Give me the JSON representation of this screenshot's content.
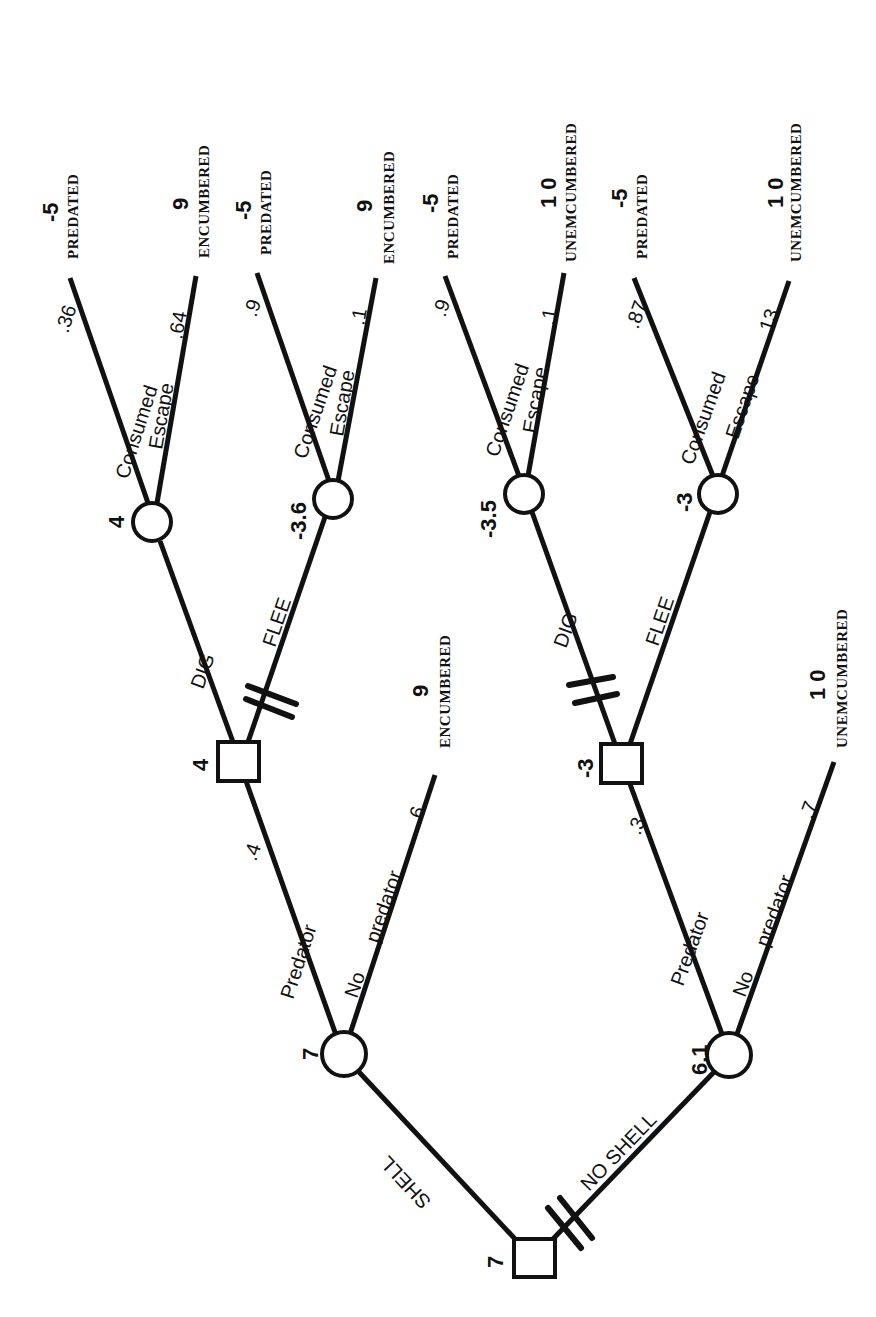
{
  "diagram": {
    "type": "decision-tree",
    "orientation": "rotated-90-ccw",
    "root": {
      "type": "decision",
      "value": "7",
      "branches": [
        {
          "label": "SHELL",
          "excluded": false,
          "node": {
            "type": "chance",
            "value": "7",
            "branches": [
              {
                "label": "Predator",
                "probability": ".4",
                "node": {
                  "type": "decision",
                  "value": "4",
                  "branches": [
                    {
                      "label": "DIG",
                      "excluded": false,
                      "node": {
                        "type": "chance",
                        "value": "4",
                        "branches": [
                          {
                            "label": "Consumed",
                            "probability": ".36",
                            "outcome": {
                              "value": "-5",
                              "label": "PREDATED"
                            }
                          },
                          {
                            "label": "Escape",
                            "probability": ".64",
                            "outcome": {
                              "value": "9",
                              "label": "ENCUMBERED"
                            }
                          }
                        ]
                      }
                    },
                    {
                      "label": "FLEE",
                      "excluded": true,
                      "node": {
                        "type": "chance",
                        "value": "-3.6",
                        "branches": [
                          {
                            "label": "Consumed",
                            "probability": ".9",
                            "outcome": {
                              "value": "-5",
                              "label": "PREDATED"
                            }
                          },
                          {
                            "label": "Escape",
                            "probability": ".1",
                            "outcome": {
                              "value": "9",
                              "label": "ENCUMBERED"
                            }
                          }
                        ]
                      }
                    }
                  ]
                }
              },
              {
                "label": "No predator",
                "probability": ".6",
                "outcome": {
                  "value": "9",
                  "label": "ENCUMBERED"
                }
              }
            ]
          }
        },
        {
          "label": "NO SHELL",
          "excluded": true,
          "node": {
            "type": "chance",
            "value": "6.1",
            "branches": [
              {
                "label": "Predator",
                "probability": ".3",
                "node": {
                  "type": "decision",
                  "value": "-3",
                  "branches": [
                    {
                      "label": "DIG",
                      "excluded": true,
                      "node": {
                        "type": "chance",
                        "value": "-3.5",
                        "branches": [
                          {
                            "label": "Consumed",
                            "probability": ".9",
                            "outcome": {
                              "value": "-5",
                              "label": "PREDATED"
                            }
                          },
                          {
                            "label": "Escape",
                            "probability": ".1",
                            "outcome": {
                              "value": "10",
                              "label": "UNEMCUMBERED"
                            }
                          }
                        ]
                      }
                    },
                    {
                      "label": "FLEE",
                      "excluded": false,
                      "node": {
                        "type": "chance",
                        "value": "-3",
                        "branches": [
                          {
                            "label": "Consumed",
                            "probability": ".87",
                            "outcome": {
                              "value": "-5",
                              "label": "PREDATED"
                            }
                          },
                          {
                            "label": "Escape",
                            "probability": ".13",
                            "outcome": {
                              "value": "10",
                              "label": "UNEMCUMBERED"
                            }
                          }
                        ]
                      }
                    }
                  ]
                }
              },
              {
                "label": "No predator",
                "probability": ".7",
                "outcome": {
                  "value": "10",
                  "label": "UNEMCUMBERED"
                }
              }
            ]
          }
        }
      ]
    }
  },
  "labels": {
    "root_value": "7",
    "shell": "SHELL",
    "no_shell": "NO SHELL",
    "shell_chance_value": "7",
    "noshell_chance_value": "6.1",
    "predator": "Predator",
    "no": "No",
    "predator_word": "predator",
    "shell_pred_prob": ".4",
    "shell_nopred_prob": ".6",
    "noshell_pred_prob": ".3",
    "noshell_nopred_prob": ".7",
    "shell_decision_value": "4",
    "noshell_decision_value": "-3",
    "dig": "DIG",
    "flee": "FLEE",
    "consumed": "Consumed",
    "escape": "Escape",
    "s_dig_value": "4",
    "s_flee_value": "-3.6",
    "n_dig_value": "-3.5",
    "n_flee_value": "-3",
    "p_s_dig_c": ".36",
    "p_s_dig_e": ".64",
    "p_s_flee_c": ".9",
    "p_s_flee_e": ".1",
    "p_n_dig_c": ".9",
    "p_n_dig_e": ".1",
    "p_n_flee_c": ".87",
    "p_n_flee_e": ".13",
    "out_neg5": "-5",
    "out_9": "9",
    "out_10": "1 0",
    "predated": "PREDATED",
    "encumbered": "ENCUMBERED",
    "unemcumbered": "UNEMCUMBERED"
  }
}
